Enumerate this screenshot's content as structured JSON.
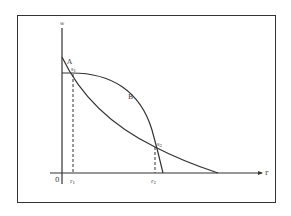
{
  "diagram": {
    "axes": {
      "y_label": "w",
      "x_label": "r",
      "origin_label": "0"
    },
    "curves": [
      {
        "name": "A",
        "label": "A"
      },
      {
        "name": "B",
        "label": "B"
      }
    ],
    "intersections": [
      {
        "label": "s",
        "sub": "1",
        "tick_label": "r",
        "tick_sub": "1"
      },
      {
        "label": "s",
        "sub": "2",
        "tick_label": "r",
        "tick_sub": "2"
      }
    ],
    "colors": {
      "line": "#333333",
      "background": "#ffffff"
    }
  }
}
